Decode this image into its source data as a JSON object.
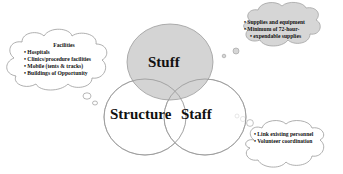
{
  "diagram": {
    "circles": [
      {
        "id": "stuff",
        "label": "Stuff",
        "fill": "#cfcfcf"
      },
      {
        "id": "structure",
        "label": "Structure",
        "fill": "#ffffff"
      },
      {
        "id": "staff",
        "label": "Staff",
        "fill": "#ffffff"
      }
    ],
    "clouds": {
      "facilities": {
        "title": "Facilities",
        "items": [
          "Hospitals",
          "Clinics/procedure facilities",
          "Mobile (tents & tracks)",
          "Buildings of Opportunity"
        ]
      },
      "stuff": {
        "items": [
          "Supplies and equipment",
          "Minimum of 72-hour-",
          "expendable supplies"
        ]
      },
      "staff": {
        "items": [
          "Link existing personnel",
          "Volunteer coordination"
        ]
      }
    },
    "colors": {
      "cloud_fill": "#d6d6d6",
      "outline": "#9a9a9a",
      "stuff_fill": "#cfcfcf"
    }
  }
}
